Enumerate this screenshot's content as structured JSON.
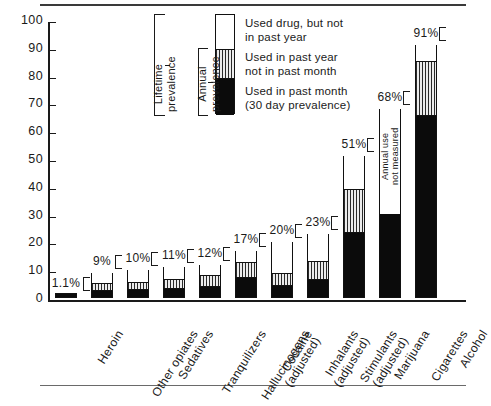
{
  "chart_data": {
    "type": "bar",
    "title": "",
    "subtitle": "",
    "xlabel": "",
    "ylabel": "Percentage - Class of 1986",
    "ylim": [
      0,
      100
    ],
    "yticks": [
      0,
      10,
      20,
      30,
      40,
      50,
      60,
      70,
      80,
      90,
      100
    ],
    "ytick_labels": [
      "0",
      "10",
      "20",
      "30",
      "40",
      "50",
      "60",
      "70",
      "80",
      "90",
      "100"
    ],
    "grid": false,
    "legend_position": "top-center",
    "categories": [
      "Heroin",
      "Other opiates",
      "Sedatives",
      "Tranquilizers",
      "Hallucinogens (adjusted)",
      "Cocaine",
      "Inhalants (adjusted)",
      "Stimulants (adjusted)",
      "Marijuana",
      "Cigarettes",
      "Alcohol"
    ],
    "series": [
      {
        "name": "Used in past month (30 day prevalence)",
        "style": "black",
        "values": [
          1.1,
          2.0,
          2.5,
          3.0,
          3.5,
          7.0,
          4.0,
          6.0,
          23.0,
          30.0,
          65.0
        ]
      },
      {
        "name": "Used in past year not in past month",
        "style": "hatched",
        "values": [
          0.0,
          3.0,
          3.0,
          3.5,
          4.5,
          5.5,
          4.5,
          7.0,
          16.0,
          0.0,
          20.0
        ]
      },
      {
        "name": "Used drug, but not in past year",
        "style": "white",
        "values": [
          0.0,
          4.0,
          4.5,
          4.5,
          4.0,
          4.5,
          11.5,
          10.0,
          12.0,
          38.0,
          6.0
        ]
      }
    ],
    "totals": [
      1.1,
      9,
      10,
      11,
      12,
      17,
      20,
      23,
      51,
      68,
      91
    ],
    "total_labels": [
      "1.1%",
      "9%",
      "10%",
      "11%",
      "12%",
      "17%",
      "20%",
      "23%",
      "51%",
      "68%",
      "91%"
    ],
    "annotations": [
      {
        "target": "Cigarettes",
        "text": "Annual use\nnot measured",
        "line1": "Annual use",
        "line2": "not measured"
      }
    ]
  },
  "legend": {
    "items": [
      {
        "style": "white",
        "line1": "Used drug, but not",
        "line2": "in past year"
      },
      {
        "style": "hatched",
        "line1": "Used in past year",
        "line2": "not in past month"
      },
      {
        "style": "black",
        "line1": "Used in past month",
        "line2": "(30 day prevalence)"
      }
    ],
    "brackets": [
      {
        "name": "lifetime",
        "line1": "Lifetime",
        "line2": "prevalence"
      },
      {
        "name": "annual",
        "line1": "Annual",
        "line2": "prevalence"
      }
    ]
  },
  "axis": {
    "ylabel": "Percentage - Class of 1986",
    "ytick_labels": [
      "100",
      "90",
      "80",
      "70",
      "60",
      "50",
      "40",
      "30",
      "20",
      "10",
      "0"
    ]
  }
}
